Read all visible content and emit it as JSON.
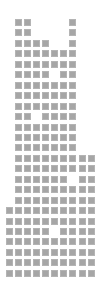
{
  "grid": {
    "columns": 10,
    "rows": 25,
    "origin_x": 5.7,
    "origin_y": 19,
    "pitch_x": 9.1,
    "pitch_y": 10.45,
    "cell_size": 7,
    "cell_color": "#a6a6a6",
    "background": "#ffffff",
    "filled": [
      [
        2,
        3,
        8
      ],
      [
        2,
        3,
        8
      ],
      [
        2,
        3,
        4,
        5,
        8
      ],
      [
        2,
        3,
        4,
        5,
        6,
        7,
        8
      ],
      [
        2,
        3,
        4,
        5,
        6,
        7,
        8
      ],
      [
        2,
        3,
        4,
        5,
        7,
        8
      ],
      [
        2,
        3,
        4,
        5,
        6,
        7,
        8
      ],
      [
        2,
        3,
        4,
        5,
        6,
        7,
        8
      ],
      [
        2,
        3,
        4,
        5,
        6,
        7,
        8
      ],
      [
        2,
        3,
        5,
        6,
        7,
        8
      ],
      [
        2,
        3,
        4,
        5,
        6,
        7,
        8
      ],
      [
        2,
        3,
        4,
        5,
        6,
        7,
        8
      ],
      [
        2,
        3,
        4,
        5,
        6,
        7,
        8
      ],
      [
        2,
        3,
        4,
        5,
        6,
        7,
        8,
        9,
        10
      ],
      [
        2,
        3,
        4,
        5,
        6,
        7,
        8,
        9,
        10
      ],
      [
        2,
        3,
        4,
        5,
        6,
        7,
        9,
        10
      ],
      [
        2,
        3,
        4,
        5,
        6,
        7,
        8,
        9,
        10
      ],
      [
        2,
        3,
        4,
        5,
        6,
        7,
        8,
        9,
        10
      ],
      [
        1,
        2,
        3,
        4,
        5,
        6,
        7,
        8,
        9,
        10
      ],
      [
        1,
        2,
        3,
        4,
        5,
        6,
        7,
        8,
        9,
        10
      ],
      [
        1,
        2,
        3,
        4,
        5,
        7,
        8,
        9,
        10
      ],
      [
        1,
        2,
        3,
        4,
        5,
        6,
        7,
        8,
        9,
        10
      ],
      [
        1,
        2,
        3,
        4,
        5,
        6,
        7,
        8,
        9,
        10
      ],
      [
        1,
        2,
        3,
        4,
        5,
        6,
        7,
        8,
        9,
        10
      ],
      [
        1,
        2,
        3,
        4,
        5,
        6,
        7,
        8,
        9,
        10
      ]
    ]
  }
}
